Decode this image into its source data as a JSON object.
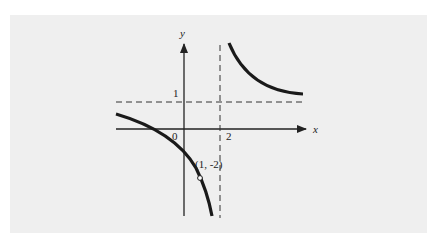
{
  "figure": {
    "background_color": "#efefef",
    "curve_color": "#1a1a1a",
    "axis_color": "#222222",
    "labels": {
      "y_axis": "y",
      "x_axis": "x",
      "origin": "0",
      "x_tick_2": "2",
      "y_tick_1": "1",
      "point": "(1, -2)"
    },
    "asymptotes": {
      "vertical": "x = 2",
      "horizontal": "y = 1"
    },
    "open_point": {
      "x": 1,
      "y": -2
    }
  }
}
